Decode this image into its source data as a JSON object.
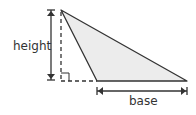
{
  "diagram": {
    "labels": {
      "height": "height",
      "base": "base"
    },
    "colors": {
      "fill": "#ececec",
      "stroke": "#333333",
      "background": "#ffffff"
    },
    "vertices": [
      [
        61,
        10
      ],
      [
        97,
        81
      ],
      [
        187,
        81
      ]
    ]
  }
}
